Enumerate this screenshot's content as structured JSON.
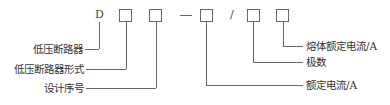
{
  "diagram": {
    "type": "model-code-structure",
    "code": {
      "prefix": "D",
      "separator_dash": "—",
      "separator_slash": "/",
      "boxes": 5
    },
    "labels_left": [
      {
        "id": "prefix",
        "text": "低压断路器"
      },
      {
        "id": "box1",
        "text": "低压断路器形式"
      },
      {
        "id": "box2",
        "text": "设计序号"
      }
    ],
    "labels_right": [
      {
        "id": "box5",
        "text": "熔体额定电流/A"
      },
      {
        "id": "box4",
        "text": "极数"
      },
      {
        "id": "box3",
        "text": "额定电流/A"
      }
    ]
  }
}
